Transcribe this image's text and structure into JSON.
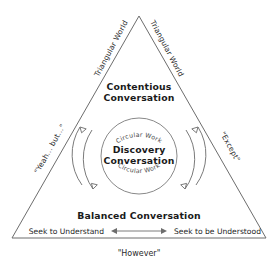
{
  "diagram": {
    "title_top_left": "Triangular World",
    "title_top_right": "Triangular World",
    "side_left_label": "\"Yeah... but...\"",
    "side_right_label": "\"Except\"",
    "top_zone_label_line1": "Contentious",
    "top_zone_label_line2": "Conversation",
    "center_zone_label_line1": "Discovery",
    "center_zone_label_line2": "Conversation",
    "bottom_zone_label": "Balanced Conversation",
    "circular_work_top": "Circular Work",
    "circular_work_bottom": "Circular Work",
    "axis_left_label": "Seek to Understand",
    "axis_right_label": "Seek to be Understood",
    "caption": "\"However\"",
    "colors": {
      "background": "#ffffff",
      "line": "#6d6d6d",
      "text": "#1a1a1a",
      "muted_text": "#4a4a4a"
    },
    "icons": {
      "rotation_left": "curved-arrow-icon",
      "rotation_right": "curved-arrow-icon",
      "axis": "double-headed-arrow-icon"
    }
  }
}
